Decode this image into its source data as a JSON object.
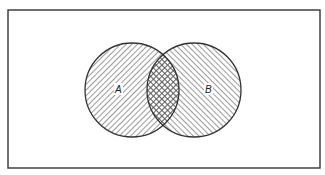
{
  "diagram": {
    "type": "venn",
    "frame": {
      "x": 8,
      "y": 10,
      "width": 312,
      "height": 158,
      "stroke": "#333333"
    },
    "sets": [
      {
        "id": "A",
        "label": "A",
        "cx": 132,
        "cy": 90,
        "r": 47,
        "hatch": "diagonal-down-right"
      },
      {
        "id": "B",
        "label": "B",
        "cx": 194,
        "cy": 90,
        "r": 47,
        "hatch": "diagonal-up-right"
      }
    ],
    "intersection": {
      "label": "",
      "hatch": "cross-hatch"
    },
    "colors": {
      "line": "#333333",
      "hatch": "#555555",
      "background": "#ffffff"
    }
  },
  "labels": {
    "set_a": "A",
    "set_b": "B"
  }
}
